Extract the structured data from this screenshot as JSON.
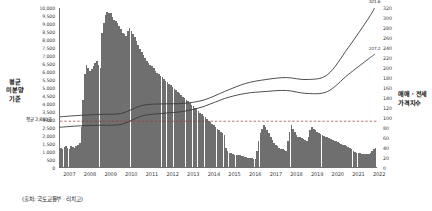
{
  "chart_data": {
    "type": "bar",
    "title": "",
    "subtitle": "",
    "source_note": "(출처: 국토교통부 · 리치고)",
    "xlabel": "",
    "grid": false,
    "legend_position": "none",
    "x_axis": {
      "tick_labels": [
        "2007",
        "2008",
        "2009",
        "2010",
        "2011",
        "2012",
        "2013",
        "2014",
        "2015",
        "2016",
        "2017",
        "2018",
        "2019",
        "2020",
        "2021",
        "2022"
      ],
      "range": [
        2007,
        2022.4
      ]
    },
    "y_axis_left": {
      "label": "평균 미분양 기준",
      "label_lines": [
        "평균",
        "미분양",
        "기준"
      ],
      "min": 0,
      "max": 10000,
      "step": 500,
      "tick_labels": [
        "10,000",
        "9,500",
        "9,000",
        "8,500",
        "8,000",
        "7,500",
        "7,000",
        "6,500",
        "6,000",
        "5,500",
        "5,000",
        "4,500",
        "4,000",
        "3,500",
        "3,000",
        "2,500",
        "2,000",
        "1,500",
        "1,000",
        "500",
        "0"
      ]
    },
    "y_axis_right": {
      "label": "매매 · 전세 가격지수",
      "label_lines": [
        "매매 · 전세",
        "가격지수"
      ],
      "min": 0,
      "max": 320,
      "step": 20,
      "tick_labels": [
        "320",
        "300",
        "280",
        "260",
        "240",
        "220",
        "200",
        "180",
        "160",
        "140",
        "120",
        "100",
        "80",
        "60",
        "40",
        "20",
        "0"
      ]
    },
    "annotations": [
      {
        "name": "average-line",
        "text": "평균 2,880호",
        "value": 2880,
        "axis": "left"
      },
      {
        "name": "series1-endpoint",
        "text": "321.6",
        "value": 321.6,
        "axis": "right"
      },
      {
        "name": "series2-endpoint",
        "text": "227.2",
        "value": 227.2,
        "axis": "right"
      }
    ],
    "series": [
      {
        "name": "미분양",
        "type": "bar",
        "color": "#6f6f6f",
        "axis": "left",
        "x": [
          2007.0,
          2007.08,
          2007.17,
          2007.25,
          2007.33,
          2007.42,
          2007.5,
          2007.58,
          2007.67,
          2007.75,
          2007.83,
          2007.92,
          2008.0,
          2008.08,
          2008.17,
          2008.25,
          2008.33,
          2008.42,
          2008.5,
          2008.58,
          2008.67,
          2008.75,
          2008.83,
          2008.92,
          2009.0,
          2009.08,
          2009.17,
          2009.25,
          2009.33,
          2009.42,
          2009.5,
          2009.58,
          2009.67,
          2009.75,
          2009.83,
          2009.92,
          2010.0,
          2010.08,
          2010.17,
          2010.25,
          2010.33,
          2010.42,
          2010.5,
          2010.58,
          2010.67,
          2010.75,
          2010.83,
          2010.92,
          2011.0,
          2011.08,
          2011.17,
          2011.25,
          2011.33,
          2011.42,
          2011.5,
          2011.58,
          2011.67,
          2011.75,
          2011.83,
          2011.92,
          2012.0,
          2012.08,
          2012.17,
          2012.25,
          2012.33,
          2012.42,
          2012.5,
          2012.58,
          2012.67,
          2012.75,
          2012.83,
          2012.92,
          2013.0,
          2013.08,
          2013.17,
          2013.25,
          2013.33,
          2013.42,
          2013.5,
          2013.58,
          2013.67,
          2013.75,
          2013.83,
          2013.92,
          2014.0,
          2014.08,
          2014.17,
          2014.25,
          2014.33,
          2014.42,
          2014.5,
          2014.58,
          2014.67,
          2014.75,
          2014.83,
          2014.92,
          2015.0,
          2015.08,
          2015.17,
          2015.25,
          2015.33,
          2015.42,
          2015.5,
          2015.58,
          2015.67,
          2015.75,
          2015.83,
          2015.92,
          2016.0,
          2016.08,
          2016.17,
          2016.25,
          2016.33,
          2016.42,
          2016.5,
          2016.58,
          2016.67,
          2016.75,
          2016.83,
          2016.92,
          2017.0,
          2017.08,
          2017.17,
          2017.25,
          2017.33,
          2017.42,
          2017.5,
          2017.58,
          2017.67,
          2017.75,
          2017.83,
          2017.92,
          2018.0,
          2018.08,
          2018.17,
          2018.25,
          2018.33,
          2018.42,
          2018.5,
          2018.58,
          2018.67,
          2018.75,
          2018.83,
          2018.92,
          2019.0,
          2019.08,
          2019.17,
          2019.25,
          2019.33,
          2019.42,
          2019.5,
          2019.58,
          2019.67,
          2019.75,
          2019.83,
          2019.92,
          2020.0,
          2020.08,
          2020.17,
          2020.25,
          2020.33,
          2020.42,
          2020.5,
          2020.58,
          2020.67,
          2020.75,
          2020.83,
          2020.92,
          2021.0,
          2021.08,
          2021.17,
          2021.25,
          2021.33,
          2021.42,
          2021.5,
          2021.58,
          2021.67,
          2021.75,
          2021.83,
          2021.92,
          2022.0,
          2022.08,
          2022.17,
          2022.25
        ],
        "values": [
          1200,
          1150,
          1250,
          1300,
          1200,
          1150,
          1300,
          1250,
          1200,
          1300,
          1400,
          1500,
          2500,
          4200,
          5800,
          6400,
          6200,
          6000,
          6100,
          6300,
          6500,
          6600,
          6400,
          6200,
          8400,
          9000,
          9500,
          9700,
          9650,
          9600,
          9400,
          9200,
          9100,
          9000,
          8800,
          8600,
          8400,
          8300,
          8200,
          8500,
          8700,
          8500,
          8300,
          8100,
          7900,
          7600,
          7400,
          7200,
          7000,
          6800,
          6600,
          6500,
          6400,
          6300,
          6200,
          6000,
          5900,
          5800,
          5700,
          5600,
          5500,
          5400,
          5300,
          5200,
          5100,
          5000,
          4900,
          4800,
          4700,
          4600,
          4500,
          4400,
          4300,
          4200,
          4100,
          4000,
          3900,
          3800,
          3700,
          3600,
          3500,
          3400,
          3300,
          3200,
          3100,
          3000,
          2900,
          2800,
          2700,
          2600,
          2500,
          2400,
          2300,
          2200,
          2100,
          2000,
          1200,
          1000,
          900,
          850,
          800,
          780,
          760,
          740,
          720,
          700,
          680,
          650,
          600,
          580,
          560,
          540,
          520,
          500,
          1000,
          1600,
          2100,
          2400,
          2600,
          2500,
          2300,
          2100,
          1900,
          1700,
          1500,
          1400,
          1300,
          1200,
          1150,
          1100,
          1050,
          1000,
          1600,
          2200,
          2600,
          2400,
          2200,
          2000,
          1900,
          1850,
          1800,
          1750,
          1700,
          1650,
          1900,
          2300,
          2500,
          2400,
          2300,
          2200,
          2100,
          2050,
          2000,
          1950,
          1900,
          1850,
          1800,
          1750,
          1700,
          1650,
          1600,
          1550,
          1500,
          1450,
          1400,
          1350,
          1300,
          1250,
          1200,
          1100,
          1000,
          950,
          900,
          870,
          850,
          830,
          820,
          810,
          800,
          820,
          900,
          1000,
          1100,
          1200
        ]
      },
      {
        "name": "매매 가격지수",
        "type": "line",
        "color": "#3b3b3b",
        "axis": "right",
        "x": [
          2007,
          2008,
          2009,
          2010,
          2011,
          2012,
          2013,
          2014,
          2015,
          2016,
          2017,
          2018,
          2019,
          2020,
          2021,
          2022,
          2022.3
        ],
        "values": [
          101,
          104,
          106,
          108,
          124,
          127,
          128,
          135,
          152,
          168,
          176,
          180,
          176,
          186,
          240,
          300,
          321.6
        ]
      },
      {
        "name": "전세 가격지수",
        "type": "line",
        "color": "#3b3b3b",
        "axis": "right",
        "x": [
          2007,
          2008,
          2009,
          2010,
          2011,
          2012,
          2013,
          2014,
          2015,
          2016,
          2017,
          2018,
          2019,
          2020,
          2021,
          2022,
          2022.3
        ],
        "values": [
          80,
          83,
          84,
          86,
          103,
          108,
          112,
          122,
          138,
          148,
          152,
          154,
          148,
          152,
          186,
          218,
          227.2
        ]
      }
    ]
  }
}
